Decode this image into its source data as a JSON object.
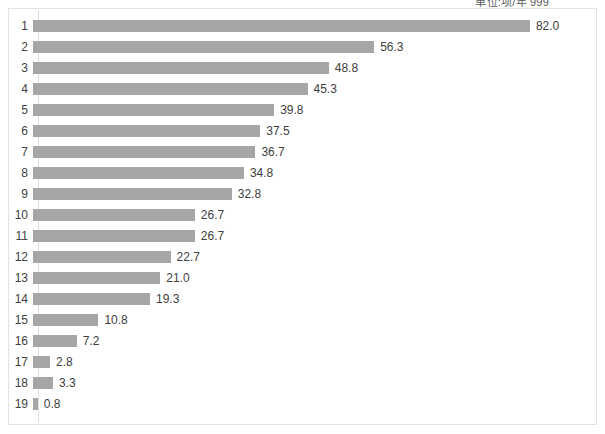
{
  "annotation": {
    "unit_label": "单位:项/年  999"
  },
  "chart_data": {
    "type": "bar",
    "orientation": "horizontal",
    "title": "",
    "subtitle": "",
    "xlabel": "",
    "ylabel": "",
    "categories": [
      "1",
      "2",
      "3",
      "4",
      "5",
      "6",
      "7",
      "8",
      "9",
      "10",
      "11",
      "12",
      "13",
      "14",
      "15",
      "16",
      "17",
      "18",
      "19"
    ],
    "values": [
      82.0,
      56.3,
      48.8,
      45.3,
      39.8,
      37.5,
      36.7,
      34.8,
      32.8,
      26.7,
      26.7,
      22.7,
      21.0,
      19.3,
      10.8,
      7.2,
      2.8,
      3.3,
      0.8
    ],
    "value_labels": [
      "82.0",
      "56.3",
      "48.8",
      "45.3",
      "39.8",
      "37.5",
      "36.7",
      "34.8",
      "32.8",
      "26.7",
      "26.7",
      "22.7",
      "21.0",
      "19.3",
      "10.8",
      "7.2",
      "2.8",
      "3.3",
      "0.8"
    ],
    "xlim": [
      0,
      82.0
    ],
    "grid": false,
    "legend": [],
    "legend_position": "none",
    "bar_color": "#a6a6a6",
    "label_color": "#404040",
    "frame_color": "#e3e3e3",
    "axis_color": "#dcdcdc"
  }
}
